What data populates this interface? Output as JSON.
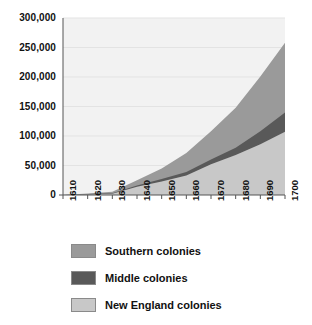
{
  "chart_data": {
    "type": "area",
    "stacked": true,
    "title": "",
    "subtitle": "",
    "xlabel": "",
    "ylabel": "",
    "grid": true,
    "legend_position": "bottom",
    "xlim": [
      1610,
      1700
    ],
    "ylim": [
      0,
      300000
    ],
    "x": [
      1610,
      1620,
      1630,
      1640,
      1650,
      1660,
      1670,
      1680,
      1690,
      1700
    ],
    "categories": [
      "1610",
      "1620",
      "1630",
      "1640",
      "1650",
      "1660",
      "1670",
      "1680",
      "1690",
      "1700"
    ],
    "ytick_labels": [
      "0",
      "50,000",
      "100,000",
      "150,000",
      "200,000",
      "250,000",
      "300,000"
    ],
    "ytick_values": [
      0,
      50000,
      100000,
      150000,
      200000,
      250000,
      300000
    ],
    "series": [
      {
        "name": "New England colonies",
        "color": "#c8c8c8",
        "values": [
          0,
          1000,
          2000,
          14000,
          23000,
          33000,
          52000,
          68000,
          86000,
          107000
        ]
      },
      {
        "name": "Middle colonies",
        "color": "#595959",
        "values": [
          0,
          500,
          1000,
          2000,
          4000,
          6000,
          8000,
          12000,
          22000,
          33000
        ]
      },
      {
        "name": "Southern colonies",
        "color": "#9a9a9a",
        "values": [
          0,
          1000,
          2500,
          9000,
          18000,
          32000,
          48000,
          68000,
          93000,
          118000
        ]
      }
    ],
    "totals": [
      0,
      2500,
      5500,
      25000,
      45000,
      71000,
      108000,
      148000,
      201000,
      258000
    ]
  },
  "legend": {
    "items": [
      {
        "label": "Southern colonies",
        "color": "#9a9a9a"
      },
      {
        "label": "Middle colonies",
        "color": "#595959"
      },
      {
        "label": "New England colonies",
        "color": "#c8c8c8"
      }
    ]
  },
  "axes": {
    "plot_background": "#f2f2f2",
    "axis_color": "#555555",
    "gridline_color": "#e3e3e3"
  }
}
